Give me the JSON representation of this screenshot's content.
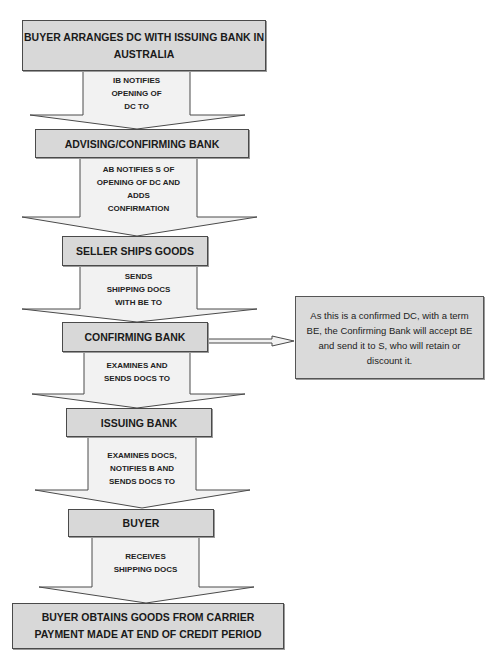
{
  "diagram": {
    "steps": [
      {
        "label_line1": "BUYER ARRANGES DC WITH ISSUING BANK IN",
        "label_line2": "AUSTRALIA"
      },
      {
        "label": "ADVISING/CONFIRMING BANK"
      },
      {
        "label": "SELLER SHIPS GOODS"
      },
      {
        "label": "CONFIRMING BANK"
      },
      {
        "label": "ISSUING BANK"
      },
      {
        "label": "BUYER"
      },
      {
        "label_line1": "BUYER OBTAINS GOODS FROM CARRIER",
        "label_line2": "PAYMENT MADE AT END OF CREDIT PERIOD"
      }
    ],
    "arrows": [
      {
        "lines": [
          "IB NOTIFIES",
          "OPENING OF",
          "DC TO"
        ]
      },
      {
        "lines": [
          "AB NOTIFIES S OF",
          "OPENING OF DC AND",
          "ADDS",
          "CONFIRMATION"
        ]
      },
      {
        "lines": [
          "SENDS",
          "SHIPPING DOCS",
          "WITH BE TO"
        ]
      },
      {
        "lines": [
          "EXAMINES AND",
          "SENDS DOCS TO"
        ]
      },
      {
        "lines": [
          "EXAMINES DOCS,",
          "NOTIFIES B AND",
          "SENDS DOCS TO"
        ]
      },
      {
        "lines": [
          "RECEIVES",
          "SHIPPING DOCS"
        ]
      }
    ],
    "callout": {
      "text": "As this is a confirmed DC, with a term BE, the Confirming Bank will accept BE and send it to S, who will retain or discount it."
    },
    "colors": {
      "box_fill": "#d8d8d8",
      "arrow_fill": "#f2f2f2",
      "border": "#4a4a4a"
    }
  }
}
